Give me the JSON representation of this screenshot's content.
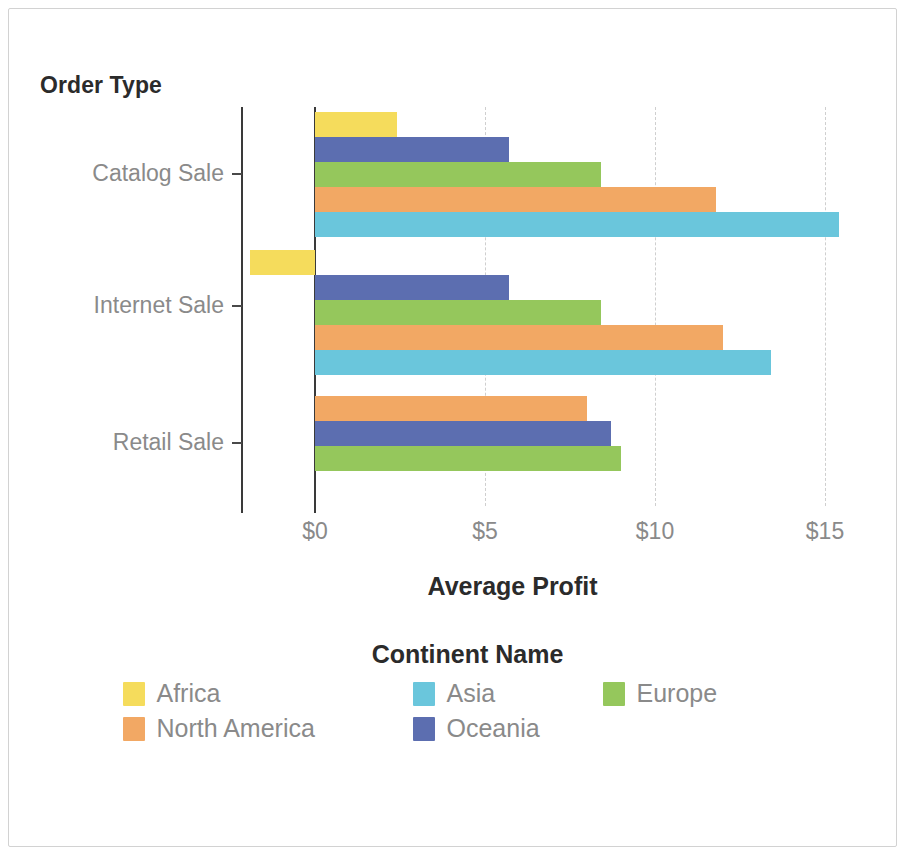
{
  "chart_data": {
    "type": "bar",
    "orientation": "horizontal",
    "title": "",
    "xlabel": "Average Profit",
    "ylabel": "Order Type",
    "legend_title": "Continent Name",
    "legend_position": "bottom",
    "grid": true,
    "xlim": [
      -2.5,
      16.2
    ],
    "x_ticks": [
      0,
      5,
      10,
      15
    ],
    "x_tick_labels": [
      "$0",
      "$5",
      "$10",
      "$15"
    ],
    "categories": [
      "Catalog Sale",
      "Internet Sale",
      "Retail Sale"
    ],
    "series": [
      {
        "name": "Africa",
        "color": "#F5DC5C",
        "values": [
          2.4,
          -1.9,
          null
        ]
      },
      {
        "name": "Asia",
        "color": "#6AC6DC",
        "values": [
          15.4,
          13.4,
          null
        ]
      },
      {
        "name": "Europe",
        "color": "#95C75C",
        "values": [
          8.4,
          8.4,
          9.0
        ]
      },
      {
        "name": "North America",
        "color": "#F2A864",
        "values": [
          11.8,
          12.0,
          8.0
        ]
      },
      {
        "name": "Oceania",
        "color": "#5C6EB0",
        "values": [
          5.7,
          5.7,
          8.7
        ]
      }
    ],
    "group_order": {
      "Catalog Sale": [
        "Africa",
        "Oceania",
        "Europe",
        "North America",
        "Asia"
      ],
      "Internet Sale": [
        "Africa",
        "Oceania",
        "Europe",
        "North America",
        "Asia"
      ],
      "Retail Sale": [
        "North America",
        "Oceania",
        "Europe"
      ]
    }
  },
  "axes": {
    "y_title": "Order Type",
    "x_title": "Average Profit",
    "y_tick_labels": [
      "Catalog Sale",
      "Internet Sale",
      "Retail Sale"
    ],
    "x_tick_labels": [
      "$0",
      "$5",
      "$10",
      "$15"
    ]
  },
  "legend": {
    "title": "Continent Name",
    "items": [
      {
        "label": "Africa",
        "color": "#F5DC5C"
      },
      {
        "label": "Asia",
        "color": "#6AC6DC"
      },
      {
        "label": "Europe",
        "color": "#95C75C"
      },
      {
        "label": "North America",
        "color": "#F2A864"
      },
      {
        "label": "Oceania",
        "color": "#5C6EB0"
      }
    ]
  }
}
